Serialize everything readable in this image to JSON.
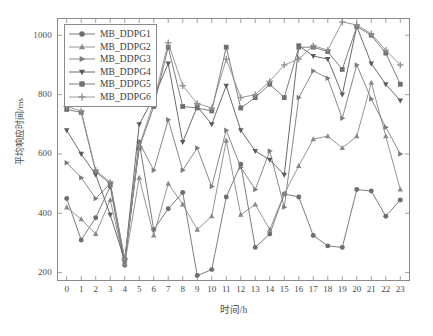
{
  "chart_data": {
    "type": "line",
    "title": "",
    "xlabel": "时间/h",
    "ylabel": "平均响应时间/ms",
    "x": [
      0,
      1,
      2,
      3,
      4,
      5,
      6,
      7,
      8,
      9,
      10,
      11,
      12,
      13,
      14,
      15,
      16,
      17,
      18,
      19,
      20,
      21,
      22,
      23
    ],
    "xtick_labels": [
      "0",
      "1",
      "2",
      "3",
      "4",
      "5",
      "6",
      "7",
      "8",
      "9",
      "10",
      "11",
      "12",
      "13",
      "14",
      "15",
      "16",
      "17",
      "18",
      "19",
      "20",
      "21",
      "22",
      "23"
    ],
    "ytick_labels": [
      "200",
      "400",
      "600",
      "800",
      "1000"
    ],
    "yticks": [
      200,
      400,
      600,
      800,
      1000
    ],
    "xlim": [
      -0.6,
      23.6
    ],
    "ylim": [
      175,
      1055
    ],
    "grid": false,
    "legend_position": "upper-left",
    "series": [
      {
        "name": "MB_DDPG1",
        "marker": "circle",
        "color": "#6e6e6e",
        "values": [
          450,
          310,
          385,
          490,
          225,
          640,
          345,
          415,
          470,
          190,
          210,
          455,
          565,
          285,
          330,
          465,
          455,
          325,
          290,
          285,
          480,
          475,
          390,
          445
        ]
      },
      {
        "name": "MB_DDPG2",
        "marker": "triangle-up",
        "color": "#8a8a8a",
        "values": [
          420,
          380,
          330,
          445,
          230,
          520,
          325,
          500,
          430,
          345,
          390,
          645,
          395,
          430,
          345,
          465,
          560,
          650,
          660,
          620,
          660,
          840,
          660,
          480
        ]
      },
      {
        "name": "MB_DDPG3",
        "marker": "triangle-right",
        "color": "#7b7b7b",
        "values": [
          570,
          520,
          450,
          500,
          235,
          640,
          545,
          715,
          545,
          620,
          490,
          680,
          555,
          480,
          610,
          420,
          790,
          880,
          855,
          720,
          900,
          785,
          690,
          600
        ]
      },
      {
        "name": "MB_DDPG4",
        "marker": "triangle-down",
        "color": "#5a5a5a",
        "values": [
          680,
          600,
          530,
          395,
          240,
          700,
          790,
          905,
          640,
          760,
          700,
          830,
          680,
          610,
          580,
          530,
          965,
          930,
          920,
          800,
          1030,
          905,
          835,
          780
        ]
      },
      {
        "name": "MB_DDPG5",
        "marker": "square",
        "color": "#707070",
        "values": [
          750,
          740,
          540,
          500,
          245,
          620,
          760,
          960,
          760,
          755,
          745,
          960,
          755,
          790,
          835,
          790,
          960,
          960,
          945,
          885,
          1030,
          1000,
          940,
          835
        ]
      },
      {
        "name": "MB_DDPG6",
        "marker": "plus",
        "color": "#8f8f8f",
        "values": [
          760,
          745,
          545,
          505,
          245,
          625,
          775,
          975,
          830,
          770,
          755,
          920,
          790,
          800,
          845,
          900,
          920,
          965,
          950,
          1045,
          1035,
          1005,
          950,
          900
        ]
      }
    ]
  }
}
